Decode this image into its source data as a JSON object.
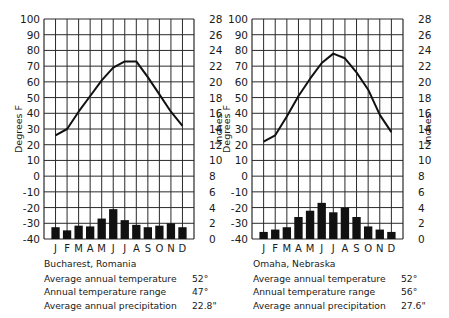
{
  "chart_data": [
    {
      "type": "bar+line",
      "title": "Bucharest, Romania",
      "x": [
        "J",
        "F",
        "M",
        "A",
        "M",
        "J",
        "J",
        "A",
        "S",
        "O",
        "N",
        "D"
      ],
      "left_axis": {
        "label": "Degrees F",
        "range": [
          -40,
          100
        ],
        "ticks": [
          100,
          90,
          80,
          70,
          60,
          50,
          40,
          30,
          20,
          10,
          0,
          -10,
          -20,
          -30,
          -40
        ]
      },
      "right_axis": {
        "label": "Inches",
        "range": [
          0,
          28
        ],
        "ticks": [
          28,
          26,
          24,
          22,
          20,
          18,
          16,
          14,
          12,
          10,
          8,
          6,
          4,
          2,
          0
        ]
      },
      "series": [
        {
          "name": "Temperature (°F)",
          "type": "line",
          "axis": "left",
          "values": [
            26,
            30,
            41,
            51,
            61,
            69,
            73,
            73,
            63,
            52,
            41,
            32
          ]
        },
        {
          "name": "Precipitation (in)",
          "type": "bar",
          "axis": "right",
          "values": [
            1.5,
            1.1,
            1.7,
            1.6,
            2.6,
            3.8,
            2.4,
            1.8,
            1.5,
            1.7,
            2.0,
            1.5
          ]
        }
      ],
      "grid": true,
      "stats": {
        "average_annual_temperature": "52°",
        "annual_temperature_range": "47°",
        "average_annual_precipitation": "22.8\""
      }
    },
    {
      "type": "bar+line",
      "title": "Omaha, Nebraska",
      "x": [
        "J",
        "F",
        "M",
        "A",
        "M",
        "J",
        "J",
        "A",
        "S",
        "O",
        "N",
        "D"
      ],
      "left_axis": {
        "label": "Degrees F",
        "range": [
          -40,
          100
        ],
        "ticks": [
          100,
          90,
          80,
          70,
          60,
          50,
          40,
          30,
          20,
          10,
          0,
          -10,
          -20,
          -30,
          -40
        ]
      },
      "right_axis": {
        "label": "Inches",
        "range": [
          0,
          28
        ],
        "ticks": [
          28,
          26,
          24,
          22,
          20,
          18,
          16,
          14,
          12,
          10,
          8,
          6,
          4,
          2,
          0
        ]
      },
      "series": [
        {
          "name": "Temperature (°F)",
          "type": "line",
          "axis": "left",
          "values": [
            22,
            26,
            38,
            51,
            62,
            72,
            78,
            75,
            66,
            55,
            39,
            28
          ]
        },
        {
          "name": "Precipitation (in)",
          "type": "bar",
          "axis": "right",
          "values": [
            0.9,
            1.2,
            1.5,
            2.8,
            3.6,
            4.6,
            3.4,
            4.0,
            2.8,
            1.6,
            1.2,
            0.9
          ]
        }
      ],
      "grid": true,
      "stats": {
        "average_annual_temperature": "52°",
        "annual_temperature_range": "56°",
        "average_annual_precipitation": "27.6\""
      }
    }
  ],
  "panels": [
    {
      "city": "Bucharest, Romania",
      "rows": [
        {
          "label": "Average annual temperature",
          "value": "52°"
        },
        {
          "label": "Annual temperature range",
          "value": "47°"
        },
        {
          "label": "Average annual precipitation",
          "value": "22.8\""
        }
      ]
    },
    {
      "city": "Omaha, Nebraska",
      "rows": [
        {
          "label": "Average annual temperature",
          "value": "52°"
        },
        {
          "label": "Annual temperature range",
          "value": "56°"
        },
        {
          "label": "Average annual precipitation",
          "value": "27.6\""
        }
      ]
    }
  ],
  "colors": {
    "ink": "#111111",
    "grid": "#2a2a2a",
    "background": "#ffffff"
  }
}
